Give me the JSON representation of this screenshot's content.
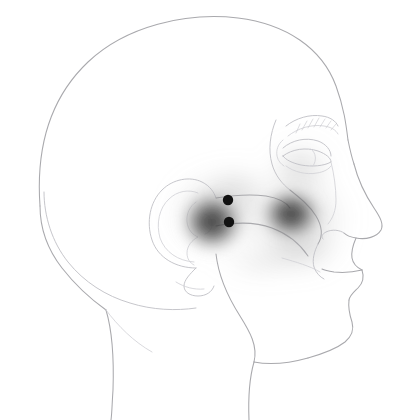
{
  "figure": {
    "title": "Lateral head profile with referred pain pattern",
    "background_color": "#ffffff",
    "outline_color": "#a9a9ad",
    "pain_color": "#3c3c3c",
    "trigger_point_color": "#121212",
    "canvas": {
      "width": 405,
      "height": 420
    }
  },
  "anatomy": {
    "parts": [
      {
        "name": "cranium",
        "label": "Cranium"
      },
      {
        "name": "forehead",
        "label": "Forehead"
      },
      {
        "name": "occiput",
        "label": "Occiput"
      },
      {
        "name": "hairline",
        "label": "Hairline"
      },
      {
        "name": "ear",
        "label": "Auricle"
      },
      {
        "name": "ear-helix",
        "label": "Helix"
      },
      {
        "name": "ear-antihelix",
        "label": "Antihelix"
      },
      {
        "name": "ear-tragus",
        "label": "Tragus"
      },
      {
        "name": "ear-lobe",
        "label": "Lobule"
      },
      {
        "name": "eye",
        "label": "Eye"
      },
      {
        "name": "eyebrow",
        "label": "Eyebrow"
      },
      {
        "name": "upper-eyelid",
        "label": "Upper eyelid"
      },
      {
        "name": "lower-eyelid",
        "label": "Lower eyelid"
      },
      {
        "name": "nose",
        "label": "Nose"
      },
      {
        "name": "nostril",
        "label": "Nostril"
      },
      {
        "name": "nasolabial-fold",
        "label": "Nasolabial fold"
      },
      {
        "name": "zygomatic-arch",
        "label": "Zygomatic arch"
      },
      {
        "name": "cheek-contour",
        "label": "Cheek contour"
      },
      {
        "name": "upper-lip",
        "label": "Upper lip"
      },
      {
        "name": "lower-lip",
        "label": "Lower lip"
      },
      {
        "name": "mouth-line",
        "label": "Mouth line"
      },
      {
        "name": "chin",
        "label": "Chin"
      },
      {
        "name": "mandible",
        "label": "Mandible"
      },
      {
        "name": "jawline",
        "label": "Jawline"
      },
      {
        "name": "neck-anterior",
        "label": "Anterior neck"
      },
      {
        "name": "neck-posterior",
        "label": "Posterior neck"
      },
      {
        "name": "sternocleidomastoid",
        "label": "Sternocleidomastoid"
      }
    ]
  },
  "trigger_points": [
    {
      "id": "tp-upper",
      "label": "Trigger point 1",
      "x": 228,
      "y": 200,
      "radius": 5.2
    },
    {
      "id": "tp-lower",
      "label": "Trigger point 2",
      "x": 229,
      "y": 222,
      "radius": 5.2
    }
  ],
  "pain_zones": [
    {
      "id": "pain-preauricular",
      "label": "Preauricular referred pain",
      "intensity": "essential",
      "cx": 212,
      "cy": 222,
      "rx": 38,
      "ry": 36,
      "peak_opacity": 0.82
    },
    {
      "id": "pain-preauricular-halo",
      "label": "Preauricular spillover",
      "intensity": "spillover",
      "cx": 216,
      "cy": 213,
      "rx": 58,
      "ry": 52,
      "peak_opacity": 0.24
    },
    {
      "id": "pain-maxillary",
      "label": "Maxillary referred pain",
      "intensity": "essential",
      "cx": 291,
      "cy": 214,
      "rx": 36,
      "ry": 31,
      "peak_opacity": 0.8
    },
    {
      "id": "pain-maxillary-halo",
      "label": "Maxillary spillover",
      "intensity": "spillover",
      "cx": 295,
      "cy": 218,
      "rx": 66,
      "ry": 58,
      "peak_opacity": 0.26
    },
    {
      "id": "pain-periorbital",
      "label": "Periorbital spillover",
      "intensity": "spillover",
      "cx": 300,
      "cy": 168,
      "rx": 42,
      "ry": 36,
      "peak_opacity": 0.18
    },
    {
      "id": "pain-infraorbital",
      "label": "Infraorbital spillover",
      "intensity": "spillover",
      "cx": 302,
      "cy": 250,
      "rx": 50,
      "ry": 32,
      "peak_opacity": 0.16
    },
    {
      "id": "pain-temporal",
      "label": "Temporal spillover",
      "intensity": "spillover",
      "cx": 238,
      "cy": 190,
      "rx": 44,
      "ry": 34,
      "peak_opacity": 0.14
    }
  ]
}
